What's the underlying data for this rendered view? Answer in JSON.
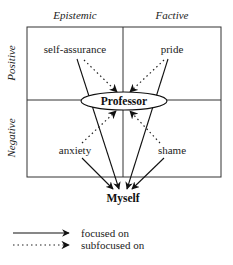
{
  "diagram": {
    "columns": [
      {
        "label": "Epistemic"
      },
      {
        "label": "Factive"
      }
    ],
    "rows": [
      {
        "label": "Positive"
      },
      {
        "label": "Negative"
      }
    ],
    "cells": {
      "positive_epistemic": "self-assurance",
      "positive_factive": "pride",
      "negative_epistemic": "anxiety",
      "negative_factive": "shame"
    },
    "targets": {
      "center": "Professor",
      "bottom": "Myself"
    },
    "edges": [
      {
        "from": "self-assurance",
        "to": "Myself",
        "style": "solid"
      },
      {
        "from": "pride",
        "to": "Myself",
        "style": "solid"
      },
      {
        "from": "anxiety",
        "to": "Myself",
        "style": "solid"
      },
      {
        "from": "shame",
        "to": "Myself",
        "style": "solid"
      },
      {
        "from": "self-assurance",
        "to": "Professor",
        "style": "dotted"
      },
      {
        "from": "pride",
        "to": "Professor",
        "style": "dotted"
      },
      {
        "from": "anxiety",
        "to": "Professor",
        "style": "dotted"
      },
      {
        "from": "shame",
        "to": "Professor",
        "style": "dotted"
      }
    ]
  },
  "legend": {
    "items": [
      {
        "style": "solid",
        "label": "focused on"
      },
      {
        "style": "dotted",
        "label": "subfocused on"
      }
    ]
  },
  "colors": {
    "line": "#222222",
    "background": "#ffffff"
  }
}
